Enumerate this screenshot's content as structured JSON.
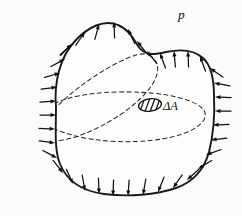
{
  "figure": {
    "name": "pressure-on-closed-body",
    "background_color": "#fbfbf9",
    "ink_color": "#111111",
    "dashed_color": "#2b2b2b"
  },
  "labels": {
    "pressure": "p",
    "area_element": "ΔA"
  },
  "label_positions": {
    "pressure": {
      "x": 178,
      "y": 19
    },
    "area_element": {
      "x": 163,
      "y": 110
    }
  },
  "area_patch": {
    "name": "delta-A-patch",
    "cx": 150,
    "cy": 105,
    "rx": 11.5,
    "ry": 6.2,
    "rotation": -8,
    "hatch_count": 4,
    "fill": "#ffffff",
    "stroke": "#111111"
  },
  "body_outline_path": "M 56 107 C 54 84 59 58 75 41 C 88 27 104 19 118 25 C 128 29 133 38 138 46 C 145 56 153 55 166 52 C 180 49 194 50 203 58 C 212 66 214 80 214 96 C 215 116 213 136 209 152 C 204 170 193 182 176 188 C 156 195 128 197 104 194 C 82 191 67 181 60 164 C 54 149 56 128 56 107 Z",
  "section_curves": [
    {
      "name": "horizontal-section-curve",
      "path": "M 43 113 C 52 100 80 93 117 92 C 155 91 190 97 202 108 C 212 118 198 131 172 137 C 142 144 100 143 72 135 C 50 129 38 121 43 113 Z"
    },
    {
      "name": "oblique-section-curve",
      "path": "M 149 55 C 163 63 160 80 140 99 C 119 119 86 136 63 140 C 42 144 36 133 48 117 C 61 99 92 76 117 63 C 133 55 143 52 149 55 Z"
    }
  ],
  "pressure_arrows": {
    "name": "uniform-pressure-arrows",
    "count": 38,
    "direction": "inward-normal",
    "shaft_length": 16,
    "head_length": 5.5,
    "head_width": 4.0,
    "items": [
      {
        "tip_x": 72,
        "tip_y": 44,
        "angle": 315
      },
      {
        "tip_x": 85,
        "tip_y": 32,
        "angle": 305
      },
      {
        "tip_x": 99,
        "tip_y": 24,
        "angle": 285
      },
      {
        "tip_x": 114,
        "tip_y": 22,
        "angle": 268
      },
      {
        "tip_x": 128,
        "tip_y": 29,
        "angle": 245
      },
      {
        "tip_x": 137,
        "tip_y": 41,
        "angle": 232
      },
      {
        "tip_x": 147,
        "tip_y": 51,
        "angle": 232
      },
      {
        "tip_x": 160,
        "tip_y": 53,
        "angle": 250
      },
      {
        "tip_x": 174,
        "tip_y": 51,
        "angle": 265
      },
      {
        "tip_x": 188,
        "tip_y": 51,
        "angle": 268
      },
      {
        "tip_x": 200,
        "tip_y": 56,
        "angle": 250
      },
      {
        "tip_x": 210,
        "tip_y": 68,
        "angle": 215
      },
      {
        "tip_x": 214,
        "tip_y": 83,
        "angle": 190
      },
      {
        "tip_x": 215,
        "tip_y": 97,
        "angle": 182
      },
      {
        "tip_x": 215,
        "tip_y": 111,
        "angle": 180
      },
      {
        "tip_x": 213,
        "tip_y": 125,
        "angle": 178
      },
      {
        "tip_x": 211,
        "tip_y": 140,
        "angle": 173
      },
      {
        "tip_x": 206,
        "tip_y": 155,
        "angle": 160
      },
      {
        "tip_x": 198,
        "tip_y": 169,
        "angle": 148
      },
      {
        "tip_x": 187,
        "tip_y": 180,
        "angle": 138
      },
      {
        "tip_x": 173,
        "tip_y": 188,
        "angle": 125
      },
      {
        "tip_x": 158,
        "tip_y": 192,
        "angle": 112
      },
      {
        "tip_x": 143,
        "tip_y": 195,
        "angle": 100
      },
      {
        "tip_x": 128,
        "tip_y": 196,
        "angle": 94
      },
      {
        "tip_x": 113,
        "tip_y": 196,
        "angle": 92
      },
      {
        "tip_x": 99,
        "tip_y": 194,
        "angle": 88
      },
      {
        "tip_x": 85,
        "tip_y": 191,
        "angle": 80
      },
      {
        "tip_x": 73,
        "tip_y": 184,
        "angle": 66
      },
      {
        "tip_x": 63,
        "tip_y": 173,
        "angle": 52
      },
      {
        "tip_x": 57,
        "tip_y": 158,
        "angle": 28
      },
      {
        "tip_x": 55,
        "tip_y": 143,
        "angle": 8
      },
      {
        "tip_x": 55,
        "tip_y": 129,
        "angle": 2
      },
      {
        "tip_x": 56,
        "tip_y": 115,
        "angle": 0
      },
      {
        "tip_x": 56,
        "tip_y": 101,
        "angle": 356
      },
      {
        "tip_x": 57,
        "tip_y": 87,
        "angle": 352
      },
      {
        "tip_x": 60,
        "tip_y": 73,
        "angle": 344
      },
      {
        "tip_x": 65,
        "tip_y": 59,
        "angle": 332
      },
      {
        "tip_x": 72,
        "tip_y": 44,
        "angle": 318
      }
    ]
  },
  "specks": [
    {
      "x": 20,
      "y": 200,
      "r": 0.7
    },
    {
      "x": 228,
      "y": 22,
      "r": 0.6
    },
    {
      "x": 106,
      "y": 208,
      "r": 0.6
    },
    {
      "x": 196,
      "y": 206,
      "r": 0.5
    }
  ]
}
